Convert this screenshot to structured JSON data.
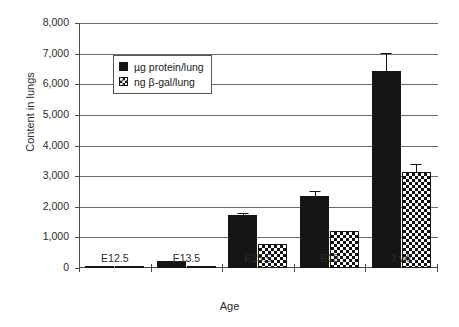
{
  "chart_data": {
    "type": "bar",
    "title": "",
    "xlabel": "Age",
    "ylabel": "Content in lungs",
    "categories": [
      "E12.5",
      "E13.5",
      "E15.5",
      "E18",
      "2 wk"
    ],
    "ylim": [
      0,
      8000
    ],
    "ytick_labels": [
      "0",
      "1,000",
      "2,000",
      "3,000",
      "4,000",
      "5,000",
      "6,000",
      "7,000",
      "8,000"
    ],
    "ytick_values": [
      0,
      1000,
      2000,
      3000,
      4000,
      5000,
      6000,
      7000,
      8000
    ],
    "grid": true,
    "legend_position": "upper-left-inside",
    "series": [
      {
        "name": "µg protein/lung",
        "swatch": "solid",
        "values": [
          60,
          215,
          1740,
          2350,
          6420
        ],
        "errors": [
          0,
          25,
          60,
          150,
          610
        ]
      },
      {
        "name": "ng β-gal/lung",
        "swatch": "checker",
        "values": [
          25,
          80,
          780,
          1215,
          3150
        ],
        "errors": [
          0,
          0,
          0,
          0,
          290
        ]
      }
    ]
  },
  "colors": {
    "series_solid": "#151515",
    "series_checker": "#101010",
    "axis": "#4a4a4a",
    "grid": "#6b6b6b",
    "background": "#ffffff"
  }
}
